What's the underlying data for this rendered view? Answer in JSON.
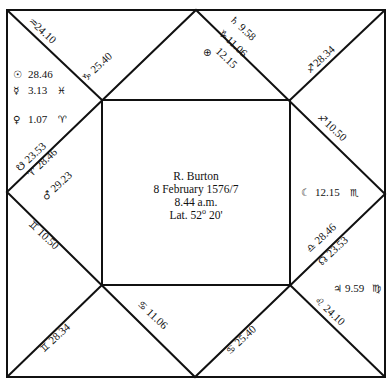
{
  "chart": {
    "center": {
      "name": "R. Burton",
      "date": "8 February 1576/7",
      "time": "8.44 a.m.",
      "latitude_prefix": "Lat. 52",
      "latitude_degree_mark": "o",
      "latitude_suffix": " 20'"
    },
    "cusps": [
      {
        "id": "c1",
        "sign": "♒",
        "value": "24.10"
      },
      {
        "id": "c2",
        "sign": "♑",
        "value": "25.40"
      },
      {
        "id": "c3",
        "sign": "♄",
        "value": "9.58"
      },
      {
        "id": "c4",
        "sign": "♐",
        "value": "28.34"
      },
      {
        "id": "c5",
        "sign": "♐",
        "value": "10.50"
      },
      {
        "id": "c6",
        "sign": "♎",
        "value": "28.46"
      },
      {
        "id": "c7",
        "sign": "♌",
        "value": "24.10"
      },
      {
        "id": "c8",
        "sign": "♋",
        "value": "25.40"
      },
      {
        "id": "c9",
        "sign": "♋",
        "value": "11.06"
      },
      {
        "id": "c10",
        "sign": "♊",
        "value": "28.34"
      },
      {
        "id": "c11",
        "sign": "♊",
        "value": "10.50"
      },
      {
        "id": "c12",
        "sign": "♈",
        "value": "28.46"
      }
    ],
    "planets": [
      {
        "id": "sun",
        "symbol": "☉",
        "value": "28.46",
        "sign": ""
      },
      {
        "id": "mercury",
        "symbol": "☿",
        "value": "3.13",
        "sign": "♓"
      },
      {
        "id": "venus",
        "symbol": "♀",
        "value": "1.07",
        "sign": "♈"
      },
      {
        "id": "south-node",
        "symbol": "☋",
        "value": "23.53",
        "sign": ""
      },
      {
        "id": "mars",
        "symbol": "♂",
        "value": "29.23",
        "sign": ""
      },
      {
        "id": "saturn-line",
        "symbol": "♑",
        "value": "11.06",
        "sign": ""
      },
      {
        "id": "part-of-fortune",
        "symbol": "⊕",
        "value": "12.15",
        "sign": ""
      },
      {
        "id": "moon",
        "symbol": "☾",
        "value": "12.15",
        "sign": "♏"
      },
      {
        "id": "north-node",
        "symbol": "☊",
        "value": "23.53",
        "sign": ""
      },
      {
        "id": "jupiter",
        "symbol": "♃",
        "value": "9.59",
        "sign": "♍"
      }
    ]
  }
}
